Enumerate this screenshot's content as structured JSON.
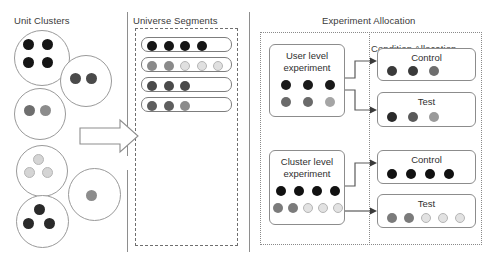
{
  "palette": {
    "black": "#151515",
    "dark_gray": "#3b3b3b",
    "mid_gray": "#6e6e6e",
    "gray": "#8c8c8c",
    "light_gray": "#c9c9c9",
    "pale_gray": "#e4e4e4",
    "outline": "#9a9a9a",
    "text": "#2f2f2f",
    "background": "#ffffff"
  },
  "panels": {
    "unit_clusters": {
      "title": "Unit Clusters",
      "clusters": [
        {
          "id": "cluster-1",
          "x": 14,
          "y": 30,
          "d": 56,
          "dots": [
            {
              "x": 13,
              "y": 13,
              "r": 5.5,
              "color": "#151515"
            },
            {
              "x": 32,
              "y": 13,
              "r": 5.5,
              "color": "#151515"
            },
            {
              "x": 13,
              "y": 31,
              "r": 5.5,
              "color": "#151515"
            },
            {
              "x": 32,
              "y": 31,
              "r": 5.5,
              "color": "#151515"
            }
          ]
        },
        {
          "id": "cluster-2",
          "x": 60,
          "y": 55,
          "d": 52,
          "dots": [
            {
              "x": 14,
              "y": 22,
              "r": 5.5,
              "color": "#4a4a4a"
            },
            {
              "x": 30,
              "y": 22,
              "r": 5.5,
              "color": "#4a4a4a"
            }
          ]
        },
        {
          "id": "cluster-3",
          "x": 14,
          "y": 88,
          "d": 52,
          "dots": [
            {
              "x": 14,
              "y": 21,
              "r": 5.5,
              "color": "#6e6e6e"
            },
            {
              "x": 30,
              "y": 21,
              "r": 5.5,
              "color": "#8c8c8c"
            }
          ]
        },
        {
          "id": "cluster-4",
          "x": 16,
          "y": 145,
          "d": 52,
          "dots": [
            {
              "x": 21,
              "y": 13,
              "r": 5.5,
              "color": "#d5d5d5"
            },
            {
              "x": 12,
              "y": 26,
              "r": 5.5,
              "color": "#d5d5d5"
            },
            {
              "x": 30,
              "y": 26,
              "r": 5.5,
              "color": "#d5d5d5"
            }
          ]
        },
        {
          "id": "cluster-5",
          "x": 68,
          "y": 168,
          "d": 53,
          "dots": [
            {
              "x": 22,
              "y": 26,
              "r": 5.5,
              "color": "#8c8c8c"
            }
          ]
        },
        {
          "id": "cluster-6",
          "x": 16,
          "y": 195,
          "d": 53,
          "dots": [
            {
              "x": 22,
              "y": 13,
              "r": 5.5,
              "color": "#2a2a2a"
            },
            {
              "x": 11,
              "y": 27,
              "r": 5.5,
              "color": "#2a2a2a"
            },
            {
              "x": 32,
              "y": 27,
              "r": 5.5,
              "color": "#2a2a2a"
            }
          ]
        }
      ]
    },
    "universe_segments": {
      "title": "Universe Segments",
      "segments": [
        {
          "id": "segment-1",
          "dots": [
            {
              "color": "#151515"
            },
            {
              "color": "#151515"
            },
            {
              "color": "#151515"
            },
            {
              "color": "#151515"
            }
          ]
        },
        {
          "id": "segment-2",
          "dots": [
            {
              "color": "#8a8a8a"
            },
            {
              "color": "#8a8a8a"
            },
            {
              "color": "#e0e0e0"
            },
            {
              "color": "#e0e0e0"
            },
            {
              "color": "#e0e0e0"
            }
          ]
        },
        {
          "id": "segment-3",
          "dots": [
            {
              "color": "#4a4a4a"
            },
            {
              "color": "#4a4a4a"
            },
            {
              "color": "#4a4a4a"
            }
          ]
        },
        {
          "id": "segment-4",
          "dots": [
            {
              "color": "#5e5e5e"
            },
            {
              "color": "#5e5e5e"
            },
            {
              "color": "#8c8c8c"
            }
          ]
        }
      ]
    },
    "experiment_allocation": {
      "title": "Experiment Allocation",
      "condition_allocation_title": "Condition Allocation",
      "experiments": [
        {
          "id": "user-level-experiment",
          "label_line1": "User level",
          "label_line2": "experiment",
          "dot_rows": [
            [
              {
                "color": "#1a1a1a"
              },
              {
                "color": "#1a1a1a"
              },
              {
                "color": "#1a1a1a"
              }
            ],
            [
              {
                "color": "#6a6a6a"
              },
              {
                "color": "#6a6a6a"
              },
              {
                "color": "#a5a5a5"
              }
            ]
          ],
          "conditions": [
            {
              "id": "condition-control-user",
              "label": "Control",
              "dots": [
                {
                  "color": "#3a3a3a"
                },
                {
                  "color": "#3a3a3a"
                },
                {
                  "color": "#6e6e6e"
                }
              ]
            },
            {
              "id": "condition-test-user",
              "label": "Test",
              "dots": [
                {
                  "color": "#2a2a2a"
                },
                {
                  "color": "#5a5a5a"
                },
                {
                  "color": "#9a9a9a"
                }
              ]
            }
          ]
        },
        {
          "id": "cluster-level-experiment",
          "label_line1": "Cluster level",
          "label_line2": "experiment",
          "dot_rows": [
            [
              {
                "color": "#111111"
              },
              {
                "color": "#111111"
              },
              {
                "color": "#111111"
              },
              {
                "color": "#111111"
              }
            ],
            [
              {
                "color": "#7b7b7b"
              },
              {
                "color": "#7b7b7b"
              },
              {
                "color": "#e2e2e2"
              },
              {
                "color": "#e2e2e2"
              },
              {
                "color": "#e2e2e2"
              }
            ]
          ],
          "conditions": [
            {
              "id": "condition-control-cluster",
              "label": "Control",
              "dots": [
                {
                  "color": "#111111"
                },
                {
                  "color": "#111111"
                },
                {
                  "color": "#111111"
                },
                {
                  "color": "#111111"
                }
              ]
            },
            {
              "id": "condition-test-cluster",
              "label": "Test",
              "dots": [
                {
                  "color": "#7b7b7b"
                },
                {
                  "color": "#7b7b7b"
                },
                {
                  "color": "#e2e2e2"
                },
                {
                  "color": "#e2e2e2"
                },
                {
                  "color": "#e2e2e2"
                }
              ]
            }
          ]
        }
      ]
    }
  },
  "connectors": {
    "clusters_to_universe": "block-arrow-right"
  }
}
